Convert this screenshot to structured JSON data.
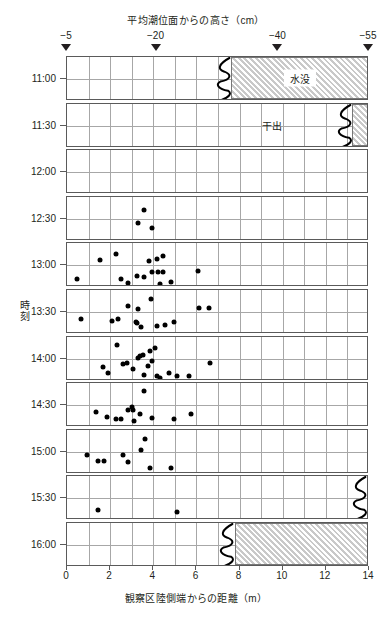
{
  "titles": {
    "top_axis_title": "平均潮位面からの高さ（cm）",
    "bottom_axis_title": "観察区陸側端からの距離（m）",
    "y_axis_title": "時刻"
  },
  "annotations": {
    "awash": "awash",
    "submerged": "水没",
    "exposed": "干出"
  },
  "chart_data": {
    "type": "scatter",
    "title": "",
    "xlabel": "観察区陸側端からの距離（m）",
    "ylabel": "時刻",
    "top_axis_label": "平均潮位面からの高さ（cm）",
    "xlim": [
      0,
      14
    ],
    "xticks": [
      0,
      2,
      4,
      6,
      8,
      10,
      12,
      14
    ],
    "xtick_labels": [
      "0",
      "2",
      "4",
      "6",
      "8",
      "10",
      "12",
      "14"
    ],
    "xgrid_minor_step": 1,
    "grid": true,
    "legend": "none",
    "top_axis": {
      "tick_positions_m": [
        0,
        4.15,
        9.8,
        14
      ],
      "tick_labels": [
        "−5",
        "−20",
        "−40",
        "−55"
      ]
    },
    "panels": [
      {
        "time_label": "11:00",
        "time_range": "10:45-11:15",
        "points": [],
        "hatch": {
          "from_m": 7.6,
          "to_m": 14,
          "label": "水没",
          "label_at_m": 10.8
        },
        "wiggle": {
          "at_m": 7.3
        },
        "awash_note": "awash"
      },
      {
        "time_label": "11:30",
        "time_range": "11:15-11:45",
        "points": [],
        "hatch": {
          "from_m": 13.2,
          "to_m": 14,
          "label": "",
          "label_at_m": null
        },
        "wiggle": {
          "at_m": 12.9
        },
        "text_label": {
          "text": "干出",
          "at_m": 9.5
        }
      },
      {
        "time_label": "12:00",
        "time_range": "11:45-12:15",
        "points": []
      },
      {
        "time_label": "12:30",
        "time_range": "12:15-12:45",
        "points": [
          {
            "x": 3.55,
            "y": 0.3
          },
          {
            "x": 3.3,
            "y": 0.6
          },
          {
            "x": 3.95,
            "y": 0.7
          }
        ]
      },
      {
        "time_label": "13:00",
        "time_range": "12:45-13:15",
        "points": [
          {
            "x": 0.45,
            "y": 0.8
          },
          {
            "x": 1.55,
            "y": 0.37
          },
          {
            "x": 2.25,
            "y": 0.25
          },
          {
            "x": 2.5,
            "y": 0.82
          },
          {
            "x": 2.85,
            "y": 0.9
          },
          {
            "x": 3.25,
            "y": 0.75
          },
          {
            "x": 3.55,
            "y": 0.77
          },
          {
            "x": 3.8,
            "y": 0.4
          },
          {
            "x": 3.95,
            "y": 0.66
          },
          {
            "x": 4.15,
            "y": 0.36
          },
          {
            "x": 4.2,
            "y": 0.64
          },
          {
            "x": 4.3,
            "y": 0.92
          },
          {
            "x": 4.45,
            "y": 0.28
          },
          {
            "x": 4.45,
            "y": 0.66
          },
          {
            "x": 4.8,
            "y": 0.88
          },
          {
            "x": 6.05,
            "y": 0.62
          }
        ]
      },
      {
        "time_label": "13:30",
        "time_range": "13:15-13:45",
        "points": [
          {
            "x": 0.65,
            "y": 0.66
          },
          {
            "x": 2.1,
            "y": 0.7
          },
          {
            "x": 2.35,
            "y": 0.66
          },
          {
            "x": 2.85,
            "y": 0.36
          },
          {
            "x": 3.2,
            "y": 0.72
          },
          {
            "x": 3.25,
            "y": 0.76
          },
          {
            "x": 3.3,
            "y": 0.44
          },
          {
            "x": 3.45,
            "y": 0.84
          },
          {
            "x": 3.9,
            "y": 0.2
          },
          {
            "x": 4.15,
            "y": 0.82
          },
          {
            "x": 4.55,
            "y": 0.8
          },
          {
            "x": 4.95,
            "y": 0.72
          },
          {
            "x": 6.1,
            "y": 0.4
          },
          {
            "x": 6.6,
            "y": 0.4
          }
        ]
      },
      {
        "time_label": "14:00",
        "time_range": "13:45-14:15",
        "points": [
          {
            "x": 1.65,
            "y": 0.7
          },
          {
            "x": 1.9,
            "y": 0.82
          },
          {
            "x": 2.3,
            "y": 0.2
          },
          {
            "x": 2.6,
            "y": 0.62
          },
          {
            "x": 2.8,
            "y": 0.6
          },
          {
            "x": 3.05,
            "y": 0.74
          },
          {
            "x": 3.3,
            "y": 0.49
          },
          {
            "x": 3.4,
            "y": 0.45
          },
          {
            "x": 3.5,
            "y": 0.42
          },
          {
            "x": 3.55,
            "y": 0.88
          },
          {
            "x": 3.75,
            "y": 0.66
          },
          {
            "x": 3.85,
            "y": 0.32
          },
          {
            "x": 3.95,
            "y": 0.56
          },
          {
            "x": 4.1,
            "y": 0.26
          },
          {
            "x": 4.15,
            "y": 0.9
          },
          {
            "x": 4.3,
            "y": 0.95
          },
          {
            "x": 4.75,
            "y": 0.82
          },
          {
            "x": 5.1,
            "y": 0.9
          },
          {
            "x": 5.65,
            "y": 0.9
          },
          {
            "x": 6.65,
            "y": 0.6
          }
        ]
      },
      {
        "time_label": "14:30",
        "time_range": "14:15-14:45",
        "points": [
          {
            "x": 1.35,
            "y": 0.66
          },
          {
            "x": 1.85,
            "y": 0.76
          },
          {
            "x": 2.25,
            "y": 0.82
          },
          {
            "x": 2.5,
            "y": 0.82
          },
          {
            "x": 2.85,
            "y": 0.62
          },
          {
            "x": 3.0,
            "y": 0.54
          },
          {
            "x": 3.05,
            "y": 0.6
          },
          {
            "x": 3.1,
            "y": 0.86
          },
          {
            "x": 3.4,
            "y": 0.7
          },
          {
            "x": 3.55,
            "y": 0.18
          },
          {
            "x": 3.95,
            "y": 0.8
          },
          {
            "x": 4.95,
            "y": 0.82
          },
          {
            "x": 5.75,
            "y": 0.7
          }
        ]
      },
      {
        "time_label": "15:00",
        "time_range": "14:45-15:15",
        "points": [
          {
            "x": 0.95,
            "y": 0.58
          },
          {
            "x": 1.45,
            "y": 0.7
          },
          {
            "x": 1.7,
            "y": 0.7
          },
          {
            "x": 2.6,
            "y": 0.58
          },
          {
            "x": 2.85,
            "y": 0.74
          },
          {
            "x": 3.45,
            "y": 0.46
          },
          {
            "x": 3.6,
            "y": 0.22
          },
          {
            "x": 3.85,
            "y": 0.86
          },
          {
            "x": 4.8,
            "y": 0.86
          }
        ]
      },
      {
        "time_label": "15:30",
        "time_range": "15:15-15:45",
        "points": [
          {
            "x": 1.45,
            "y": 0.76
          },
          {
            "x": 5.1,
            "y": 0.82
          }
        ],
        "wiggle": {
          "at_m": 13.6
        }
      },
      {
        "time_label": "16:00",
        "time_range": "15:45-16:15",
        "points": [],
        "hatch": {
          "from_m": 7.8,
          "to_m": 14,
          "label": "",
          "label_at_m": null
        },
        "wiggle": {
          "at_m": 7.4
        }
      }
    ]
  },
  "colors": {
    "dot": "#000000",
    "panel_border": "#5a5a5a",
    "grid": "#a7a7a7",
    "hatch_fill": "#c9c9c9",
    "text": "#231f20"
  }
}
